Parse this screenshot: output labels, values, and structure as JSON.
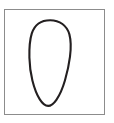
{
  "figure": {
    "caption": "Hand-drawn vertical oval (egg shape) centered inside a thin rectangular border",
    "background_color": "#ffffff"
  },
  "frame": {
    "name": "rectangular border",
    "stroke_color": "#8c8c8c",
    "stroke_width": 1.2,
    "fill_color": "#ffffff",
    "x": 4.5,
    "y": 9.5,
    "width": 100,
    "height": 105
  },
  "shape": {
    "name": "oval",
    "description": "closed ovoid outline, broader at the top, tapering to a narrower rounded bottom",
    "stroke_color": "#231f20",
    "stroke_width": 2.1,
    "fill_color": "none",
    "center_x": 50,
    "center_y": 63,
    "width": 41,
    "height": 86,
    "top_y": 20,
    "bottom_y": 106,
    "left_x": 29.5,
    "right_x": 70.5,
    "path": "M 50.2 20.2 C 59.6 20.2 67.0 25.6 69.4 34.4 C 71.2 41.2 71.0 48.8 70.0 56.6 C 69.0 64.6 67.2 72.6 65.0 80.2 C 62.8 87.8 60.0 94.6 56.4 99.8 C 53.6 103.8 51.0 105.9 48.2 105.9 C 45.2 105.9 42.4 103.6 39.8 99.4 C 36.6 94.2 34.2 87.6 32.4 80.4 C 30.6 73.2 29.6 65.4 29.4 57.6 C 29.2 49.0 29.6 40.4 31.8 33.4 C 34.6 24.8 41.2 20.2 50.2 20.2 Z"
  }
}
